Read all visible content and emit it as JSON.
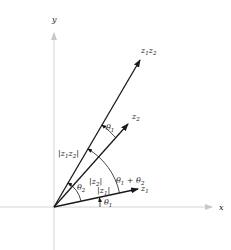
{
  "diagram": {
    "axes": {
      "x_label": "x",
      "y_label": "y"
    },
    "vectors": [
      {
        "id": "z1",
        "label": "z",
        "sub": "1"
      },
      {
        "id": "z2",
        "label": "z",
        "sub": "2"
      },
      {
        "id": "z1z2",
        "label": "z",
        "sub": "1",
        "label2": "z",
        "sub2": "2"
      }
    ],
    "modulus_labels": {
      "z1": {
        "text": "|z",
        "sub": "1",
        "close": "|"
      },
      "z2": {
        "text": "|z",
        "sub": "2",
        "close": "|"
      },
      "z1z2": {
        "text": "|z",
        "sub": "1",
        "mid": "z",
        "sub2": "2",
        "close": "|"
      }
    },
    "angle_labels": {
      "theta1_bottom": {
        "text": "θ",
        "sub": "1"
      },
      "theta2": {
        "text": "θ",
        "sub": "2"
      },
      "theta1_top": {
        "text": "θ",
        "sub": "1"
      },
      "sum": {
        "text": "θ",
        "sub": "1",
        "plus": " + θ",
        "sub2": "2"
      }
    },
    "colors": {
      "axis": "#c8c8c8",
      "vector": "#1a1a1a",
      "text": "#222222"
    }
  }
}
